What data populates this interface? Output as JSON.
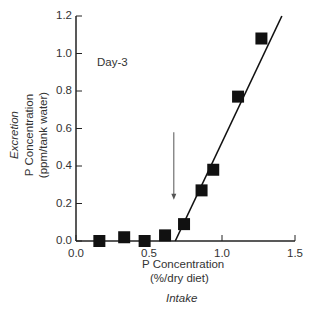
{
  "chart_data": {
    "type": "scatter",
    "title": "",
    "annotation": "Day-3",
    "xlabel": "P Concentration",
    "xlabel_units": "(%/dry diet)",
    "xlabel_caption": "Intake",
    "ylabel_caption": "Excretion",
    "ylabel": "P Concentration",
    "ylabel_units": "(ppm/tank water)",
    "xlim": [
      0.0,
      1.5
    ],
    "ylim": [
      0.0,
      1.2
    ],
    "xticks": [
      "0.0",
      "0.5",
      "1.0",
      "1.5"
    ],
    "yticks": [
      "0.0",
      "0.2",
      "0.4",
      "0.6",
      "0.8",
      "1.0",
      "1.2"
    ],
    "grid": false,
    "legend": null,
    "series": [
      {
        "name": "Excretion",
        "marker": "square",
        "x": [
          0.16,
          0.33,
          0.47,
          0.61,
          0.74,
          0.86,
          0.94,
          1.11,
          1.27
        ],
        "y": [
          0.0,
          0.02,
          0.0,
          0.03,
          0.09,
          0.27,
          0.38,
          0.77,
          1.08
        ]
      }
    ],
    "fit_line": {
      "x": [
        0.68,
        1.41
      ],
      "y": [
        0.0,
        1.2
      ]
    },
    "arrow": {
      "x": 0.67,
      "y_from": 0.58,
      "y_to": 0.22,
      "meaning": "breakpoint"
    }
  }
}
